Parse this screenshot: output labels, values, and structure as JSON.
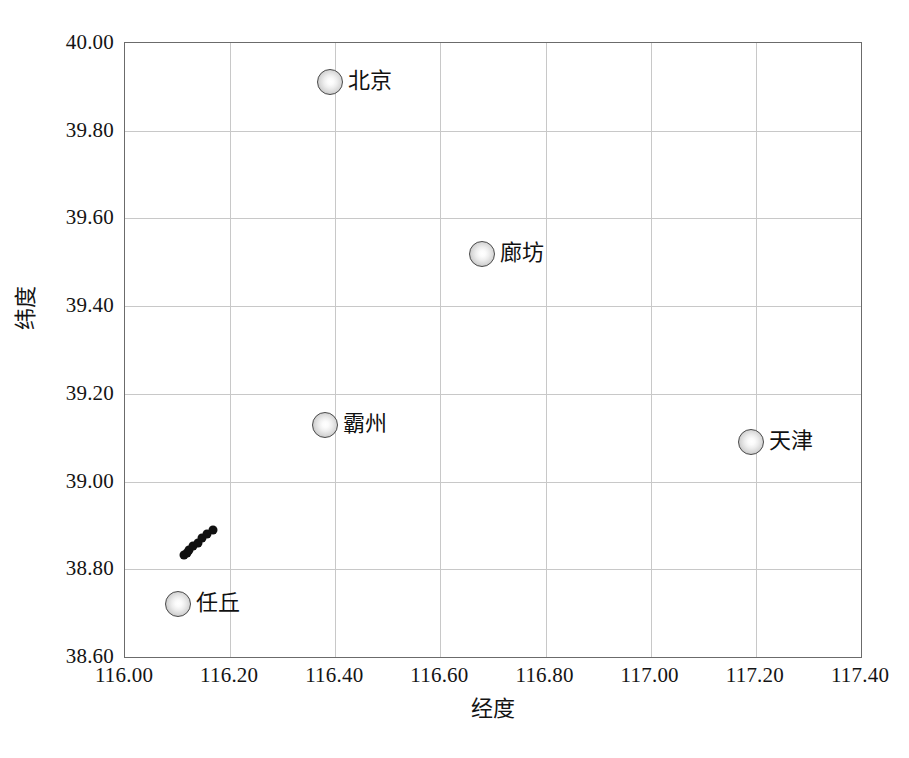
{
  "chart_data": {
    "type": "scatter",
    "title": "",
    "xlabel": "经度",
    "ylabel": "纬度",
    "xlim": [
      116.0,
      117.4
    ],
    "ylim": [
      38.6,
      40.0
    ],
    "xticks": [
      "116.00",
      "116.20",
      "116.40",
      "116.60",
      "116.80",
      "117.00",
      "117.20",
      "117.40"
    ],
    "xtick_values": [
      116.0,
      116.2,
      116.4,
      116.6,
      116.8,
      117.0,
      117.2,
      117.4
    ],
    "yticks": [
      "38.60",
      "38.80",
      "39.00",
      "39.20",
      "39.40",
      "39.60",
      "39.80",
      "40.00"
    ],
    "ytick_values": [
      38.6,
      38.8,
      39.0,
      39.2,
      39.4,
      39.6,
      39.8,
      40.0
    ],
    "grid": true,
    "legend": "none",
    "series": [
      {
        "name": "城市",
        "marker": "sphere-circle",
        "points": [
          {
            "label": "北京",
            "x": 116.39,
            "y": 39.91
          },
          {
            "label": "廊坊",
            "x": 116.68,
            "y": 39.52
          },
          {
            "label": "霸州",
            "x": 116.38,
            "y": 39.13
          },
          {
            "label": "天津",
            "x": 117.19,
            "y": 39.09
          },
          {
            "label": "任丘",
            "x": 116.1,
            "y": 38.72
          }
        ]
      },
      {
        "name": "监测点",
        "marker": "small-black-dot",
        "points": [
          {
            "label": "",
            "x": 116.113,
            "y": 38.832
          },
          {
            "label": "",
            "x": 116.118,
            "y": 38.837
          },
          {
            "label": "",
            "x": 116.122,
            "y": 38.845
          },
          {
            "label": "",
            "x": 116.13,
            "y": 38.852
          },
          {
            "label": "",
            "x": 116.138,
            "y": 38.86
          },
          {
            "label": "",
            "x": 116.147,
            "y": 38.872
          },
          {
            "label": "",
            "x": 116.156,
            "y": 38.881
          },
          {
            "label": "",
            "x": 116.168,
            "y": 38.89
          }
        ]
      }
    ]
  },
  "axis": {
    "x_title": "经度",
    "y_title": "纬度"
  },
  "caption": ""
}
